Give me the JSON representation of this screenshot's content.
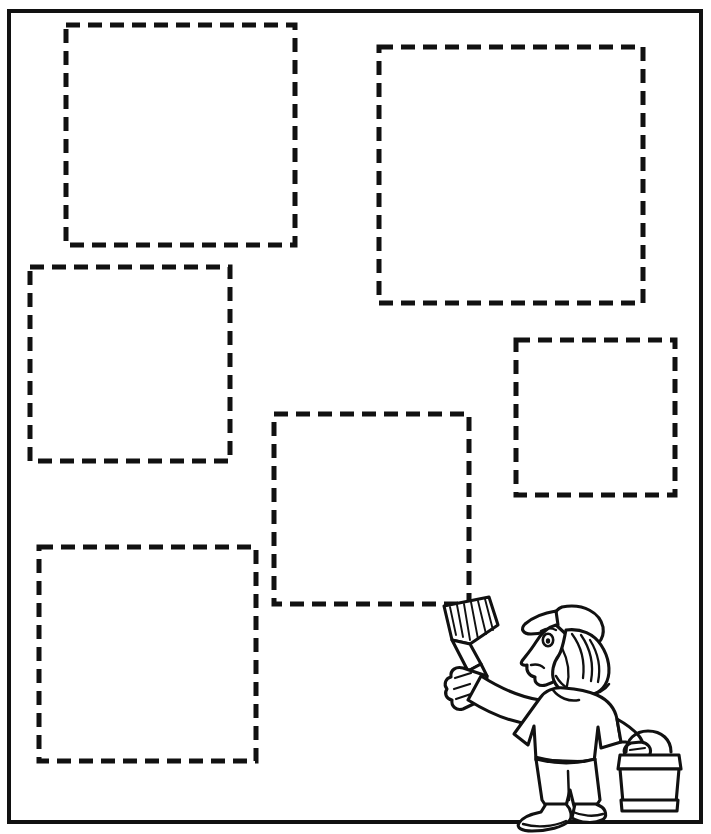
{
  "page": {
    "width": 711,
    "height": 834,
    "background_color": "#ffffff",
    "ink_color": "#111111"
  },
  "instruction": {
    "text": "Color each square a different color.",
    "visible_fragment": "square a different color.",
    "clipped_at_top": true
  },
  "frame": {
    "label": "worksheet-border",
    "x": 9,
    "y": 11,
    "width": 692,
    "height": 811,
    "stroke_width": 4,
    "color": "#111111"
  },
  "squares": {
    "count": 6,
    "style": {
      "dash_length": 14,
      "gap_length": 8,
      "stroke_width": 5,
      "color": "#111111",
      "fill": "none"
    },
    "items": [
      {
        "id": "square-1",
        "position": "top-left",
        "x": 66,
        "y": 25,
        "width": 229,
        "height": 220
      },
      {
        "id": "square-2",
        "position": "top-right",
        "x": 379,
        "y": 47,
        "width": 264,
        "height": 256
      },
      {
        "id": "square-3",
        "position": "middle-left",
        "x": 30,
        "y": 267,
        "width": 200,
        "height": 194
      },
      {
        "id": "square-4",
        "position": "middle-right",
        "x": 516,
        "y": 340,
        "width": 159,
        "height": 155
      },
      {
        "id": "square-5",
        "position": "center",
        "x": 274,
        "y": 414,
        "width": 195,
        "height": 190
      },
      {
        "id": "square-6",
        "position": "bottom-left",
        "x": 39,
        "y": 547,
        "width": 217,
        "height": 214
      }
    ]
  },
  "illustration": {
    "name": "painter-figure",
    "description": "Cartoon painter wearing a cap with long hair, holding a paintbrush up to the center square and carrying a paint bucket.",
    "parts": [
      {
        "name": "paint-brush",
        "held_in": "raised-arm"
      },
      {
        "name": "cap"
      },
      {
        "name": "face-profile"
      },
      {
        "name": "long-hair"
      },
      {
        "name": "shirt"
      },
      {
        "name": "pants"
      },
      {
        "name": "shoes"
      },
      {
        "name": "paint-bucket",
        "held_in": "lowered-arm"
      }
    ],
    "bounds": {
      "x": 437,
      "y": 595,
      "width": 258,
      "height": 225
    }
  }
}
